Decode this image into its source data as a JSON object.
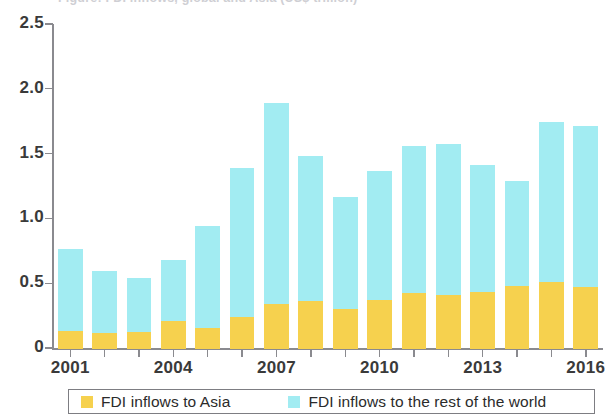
{
  "figure": {
    "cropped_title_fragment": "Figure: FDI inflows, global and Asia (US$ trillion)"
  },
  "legend": {
    "items": [
      {
        "label": "FDI inflows to Asia",
        "color": "#F6D14E",
        "key": "asia"
      },
      {
        "label": "FDI inflows to the rest of the world",
        "color": "#A2ECF2",
        "key": "rest"
      }
    ]
  },
  "axes": {
    "y": {
      "ticks": [
        "0",
        "0.5",
        "1.0",
        "1.5",
        "2.0",
        "2.5"
      ],
      "tick_values": [
        0,
        0.5,
        1.0,
        1.5,
        2.0,
        2.5
      ],
      "min": 0,
      "max": 2.5
    },
    "x": {
      "labels": [
        "2001",
        "2004",
        "2007",
        "2010",
        "2013",
        "2016"
      ],
      "label_years": [
        2001,
        2004,
        2007,
        2010,
        2013,
        2016
      ]
    }
  },
  "chart_data": {
    "type": "bar",
    "stacked": true,
    "title": "FDI inflows, global and Asia",
    "xlabel": "",
    "ylabel": "",
    "ylim": [
      0,
      2.5
    ],
    "yticks": [
      0,
      0.5,
      1.0,
      1.5,
      2.0,
      2.5
    ],
    "grid": false,
    "legend_position": "bottom",
    "categories": [
      "2001",
      "2002",
      "2003",
      "2004",
      "2005",
      "2006",
      "2007",
      "2008",
      "2009",
      "2010",
      "2011",
      "2012",
      "2013",
      "2014",
      "2015",
      "2016"
    ],
    "series": [
      {
        "name": "FDI inflows to Asia",
        "color": "#F6D14E",
        "values": [
          0.14,
          0.12,
          0.13,
          0.22,
          0.16,
          0.25,
          0.35,
          0.37,
          0.31,
          0.38,
          0.43,
          0.42,
          0.44,
          0.49,
          0.52,
          0.48
        ]
      },
      {
        "name": "FDI inflows to the rest of the world",
        "color": "#A2ECF2",
        "values": [
          0.63,
          0.48,
          0.42,
          0.47,
          0.79,
          1.15,
          1.55,
          1.12,
          0.86,
          0.99,
          1.14,
          1.16,
          0.98,
          0.81,
          1.23,
          1.24
        ]
      }
    ],
    "totals": [
      0.77,
      0.6,
      0.55,
      0.69,
      0.95,
      1.4,
      1.9,
      1.49,
      1.17,
      1.37,
      1.57,
      1.58,
      1.42,
      1.3,
      1.75,
      1.72
    ]
  }
}
